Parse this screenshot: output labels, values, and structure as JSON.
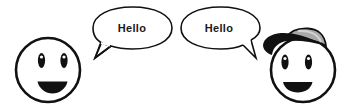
{
  "scene": {
    "background": "#ffffff",
    "stroke_color": "#111111",
    "cap_crown_color": "#a8a8a8"
  },
  "characters": [
    {
      "id": "left",
      "has_cap": false,
      "expression": "smiling",
      "speech": "Hello"
    },
    {
      "id": "right",
      "has_cap": true,
      "expression": "smiling",
      "speech": "Hello"
    }
  ]
}
